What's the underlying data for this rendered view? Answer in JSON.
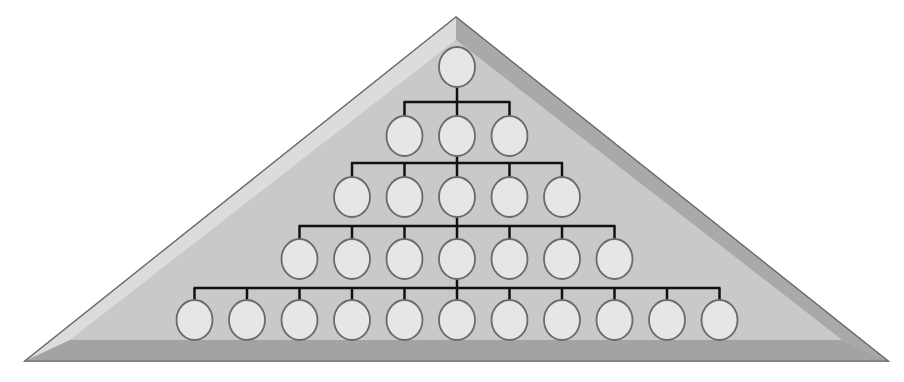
{
  "diagram": {
    "type": "hierarchy-pyramid",
    "colors": {
      "background": "#ffffff",
      "pyramid_face": "#c9c9c9",
      "pyramid_bevel_light": "#dcdcdc",
      "pyramid_bevel_dark": "#a9a9a9",
      "pyramid_outline": "#6e6e6e",
      "connector": "#111111",
      "node_fill": "#e6e6e6",
      "node_stroke": "#6a6a6a"
    },
    "levels": [
      {
        "level": 1,
        "node_count": 1
      },
      {
        "level": 2,
        "node_count": 3
      },
      {
        "level": 3,
        "node_count": 5
      },
      {
        "level": 4,
        "node_count": 7
      },
      {
        "level": 5,
        "node_count": 11
      }
    ]
  }
}
